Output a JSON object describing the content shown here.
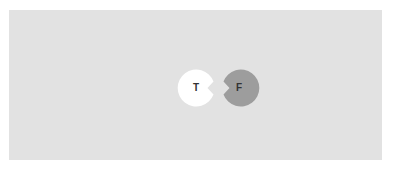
{
  "canvas": {
    "background": "#ffffff",
    "panel_color": "#e2e2e2"
  },
  "toggle": {
    "true_option": {
      "label": "T",
      "fill": "#ffffff",
      "text_color": "#333333"
    },
    "false_option": {
      "label": "F",
      "fill": "#9d9d9d",
      "text_color": "#333333"
    }
  }
}
